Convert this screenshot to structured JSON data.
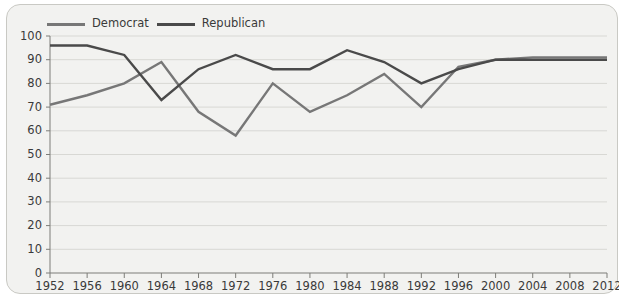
{
  "chart_data": {
    "type": "line",
    "title": "",
    "subtitle": "",
    "xlabel": "",
    "ylabel": "",
    "categories": [
      "1952",
      "1956",
      "1960",
      "1964",
      "1968",
      "1972",
      "1976",
      "1980",
      "1984",
      "1988",
      "1992",
      "1996",
      "2000",
      "2004",
      "2008",
      "2012"
    ],
    "x": [
      1952,
      1956,
      1960,
      1964,
      1968,
      1972,
      1976,
      1980,
      1984,
      1988,
      1992,
      1996,
      2000,
      2004,
      2008,
      2012
    ],
    "ylim": [
      0,
      100
    ],
    "ytick_labels": [
      "0",
      "10",
      "20",
      "30",
      "40",
      "50",
      "60",
      "70",
      "80",
      "90",
      "100"
    ],
    "ytick_values": [
      0,
      10,
      20,
      30,
      40,
      50,
      60,
      70,
      80,
      90,
      100
    ],
    "grid": "horizontal",
    "legend_position": "top-left",
    "series": [
      {
        "name": "Democrat",
        "color": "#777777",
        "values": [
          71,
          75,
          80,
          89,
          68,
          58,
          80,
          68,
          75,
          84,
          70,
          87,
          90,
          91,
          91,
          91
        ]
      },
      {
        "name": "Republican",
        "color": "#4a4a4a",
        "values": [
          96,
          96,
          92,
          73,
          86,
          92,
          86,
          86,
          94,
          89,
          80,
          86,
          90,
          90,
          90,
          90
        ]
      }
    ]
  },
  "legend": {
    "items": [
      {
        "label": "Democrat",
        "color": "#777777"
      },
      {
        "label": "Republican",
        "color": "#4a4a4a"
      }
    ]
  },
  "frame": {
    "background": "#f2f2f0",
    "border_color": "#c9c9c4"
  },
  "axes": {
    "axis_color": "#7d7d78",
    "grid_color": "#d8d8d4",
    "text_color": "#3a3a3a"
  }
}
